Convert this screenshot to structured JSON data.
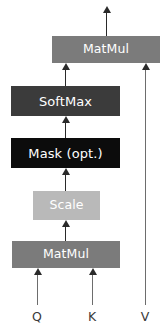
{
  "diagram": {
    "type": "flowchart",
    "nodes": [
      {
        "id": "matmul_top",
        "label": "MatMul",
        "color": "#7b7b7b",
        "text_color": "#ffffff"
      },
      {
        "id": "softmax",
        "label": "SoftMax",
        "color": "#3b3b3b",
        "text_color": "#ffffff"
      },
      {
        "id": "mask",
        "label": "Mask (opt.)",
        "color": "#0c0c0c",
        "text_color": "#ffffff"
      },
      {
        "id": "scale",
        "label": "Scale",
        "color": "#b9b9b9",
        "text_color": "#ffffff"
      },
      {
        "id": "matmul_bottom",
        "label": "MatMul",
        "color": "#7b7b7b",
        "text_color": "#ffffff"
      }
    ],
    "inputs": [
      {
        "id": "q",
        "label": "Q"
      },
      {
        "id": "k",
        "label": "K"
      },
      {
        "id": "v",
        "label": "V"
      }
    ],
    "edges": [
      {
        "from": "matmul_top",
        "to": "output"
      },
      {
        "from": "softmax",
        "to": "matmul_top"
      },
      {
        "from": "mask",
        "to": "softmax"
      },
      {
        "from": "scale",
        "to": "mask"
      },
      {
        "from": "matmul_bottom",
        "to": "scale"
      },
      {
        "from": "q",
        "to": "matmul_bottom"
      },
      {
        "from": "k",
        "to": "matmul_bottom"
      },
      {
        "from": "v",
        "to": "matmul_top"
      }
    ],
    "edge_color": "#6d6d6d",
    "arrow_color": "#2a2a2a",
    "background": "#ffffff"
  }
}
